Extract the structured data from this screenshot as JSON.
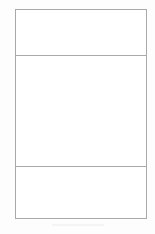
{
  "page": {
    "title": "",
    "background_color": "#fdfdfd",
    "width": 155,
    "height": 234
  },
  "frame": {
    "name": "wireframe-frame",
    "border_color": "#a9a9a9",
    "fill_color": "#ffffff",
    "border_width": 1,
    "x": 15,
    "y": 9,
    "width": 132,
    "height": 210
  },
  "panels": [
    {
      "id": "panel-header",
      "label": "",
      "region": "header",
      "text": "",
      "height": 46,
      "fill_color": "#ffffff",
      "border_color": "#a9a9a9"
    },
    {
      "id": "panel-body",
      "label": "",
      "region": "body",
      "text": "",
      "height": 111,
      "fill_color": "#ffffff",
      "border_color": "#a9a9a9"
    },
    {
      "id": "panel-footer",
      "label": "",
      "region": "footer",
      "text": "",
      "height": 51,
      "fill_color": "#ffffff",
      "border_color": "#a9a9a9"
    }
  ],
  "dividers": [
    {
      "id": "divider-header-body",
      "y": 56,
      "color": "#a9a9a9"
    },
    {
      "id": "divider-body-footer",
      "y": 167,
      "color": "#a9a9a9"
    }
  ],
  "artifact": {
    "id": "page-artifact",
    "color": "#f2f2f2",
    "x": 52,
    "y": 224,
    "width": 52,
    "height": 2
  }
}
